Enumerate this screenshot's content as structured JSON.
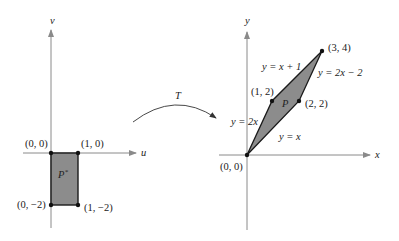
{
  "left_panel": {
    "axis_h_label": "u",
    "axis_v_label": "v",
    "region_label": "P*",
    "region_label_base": "P",
    "region_label_sup": "*",
    "vertices": [
      {
        "label": "(0, 0)"
      },
      {
        "label": "(1, 0)"
      },
      {
        "label": "(0, −2)"
      },
      {
        "label": "(1, −2)"
      }
    ]
  },
  "transform": {
    "label": "T"
  },
  "right_panel": {
    "axis_h_label": "x",
    "axis_v_label": "y",
    "region_label": "P",
    "vertices": [
      {
        "label": "(0, 0)"
      },
      {
        "label": "(1, 2)"
      },
      {
        "label": "(2, 2)"
      },
      {
        "label": "(3, 4)"
      }
    ],
    "edges": [
      {
        "label": "y = x + 1"
      },
      {
        "label": "y = 2x − 2"
      },
      {
        "label": "y = 2x"
      },
      {
        "label": "y = x"
      }
    ]
  },
  "colors": {
    "axis": "#8a8a8a",
    "region_fill": "#8c8c8c",
    "edge": "#1a1a1a",
    "point": "#111111",
    "text": "#222222"
  }
}
